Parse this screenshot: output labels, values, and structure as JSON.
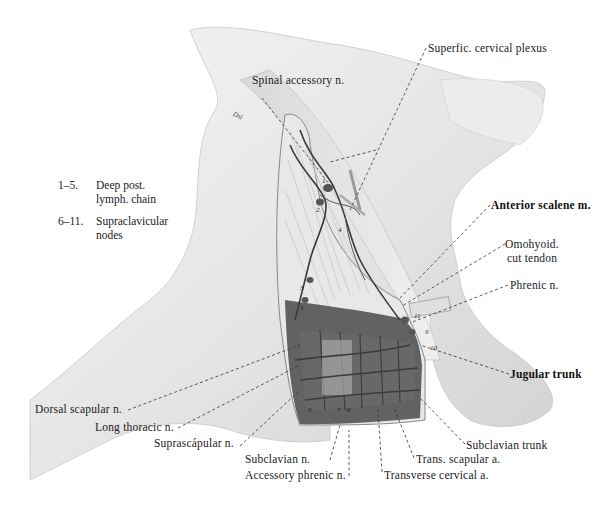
{
  "figure": {
    "signature": "Dsl"
  },
  "legend": [
    {
      "range": "1–5.",
      "text_line1": "Deep post.",
      "text_line2": "lymph. chain"
    },
    {
      "range": "6–11.",
      "text_line1": "Supraclavicular",
      "text_line2": "nodes"
    }
  ],
  "labels": {
    "superfic_cervical_plexus": "Superfic. cervical plexus",
    "spinal_accessory_n": "Spinal accessory n.",
    "anterior_scalene_m": "Anterior scalene m.",
    "omohyoid_line1": "Omohyoid.",
    "omohyoid_line2": "cut tendon",
    "phrenic_n": "Phrenic n.",
    "jugular_trunk": "Jugular trunk",
    "subclavian_trunk": "Subclavian trunk",
    "trans_scapular_a": "Trans. scapular a.",
    "transverse_cervical_a": "Transverse cervical a.",
    "accessory_phrenic_n": "Accessory phrenic n.",
    "subclavian_n": "Subclavian n.",
    "suprascapular_n": "Suprascápular n.",
    "long_thoracic_n": "Long thoracic n.",
    "dorsal_scapular_n": "Dorsal scapular n."
  },
  "node_markers": [
    "1",
    "2",
    "3",
    "4",
    "5",
    "6",
    "7",
    "8",
    "9",
    "10",
    "11"
  ]
}
